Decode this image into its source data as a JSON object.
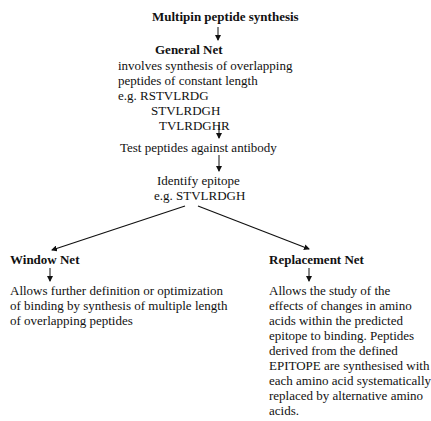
{
  "diagram": {
    "title": "Multipin peptide synthesis",
    "general_net": {
      "heading": "General Net",
      "lines": [
        "involves synthesis of overlapping",
        "peptides of constant length",
        "e.g. RSTVLRDG",
        "STVLRDGH",
        "TVLRDGHR"
      ]
    },
    "test_step": "Test peptides against antibody",
    "identify_step": {
      "line1": "Identify epitope",
      "line2": "e.g. STVLRDGH"
    },
    "window_net": {
      "heading": "Window Net",
      "lines": [
        "Allows further definition or optimization",
        "of binding by synthesis of multiple length",
        "of overlapping peptides"
      ]
    },
    "replacement_net": {
      "heading": "Replacement Net",
      "lines": [
        "Allows the study of the",
        "effects of changes in amino",
        "acids within the predicted",
        "epitope to binding. Peptides",
        "derived from the defined",
        "EPITOPE are synthesised with",
        "each amino acid systematically",
        "replaced by alternative amino",
        "acids."
      ]
    },
    "colors": {
      "text": "#111111",
      "arrow": "#111111",
      "background": "#ffffff"
    }
  }
}
